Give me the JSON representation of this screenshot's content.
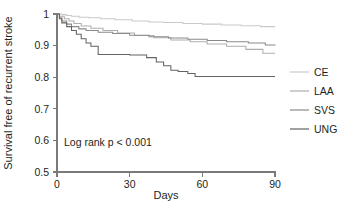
{
  "figure": {
    "type": "kaplan-meier-survival-plot",
    "background_color": "#ffffff",
    "annotation": "Log rank p < 0.001"
  },
  "axes": {
    "x_title": "Days",
    "y_title": "Survival free of recurrent stroke",
    "x_ticks": [
      "0",
      "30",
      "60",
      "90"
    ],
    "y_ticks": [
      "0.5",
      "0.6",
      "0.7",
      "0.8",
      "0.9",
      "1"
    ]
  },
  "legend": {
    "position": "right",
    "entries": [
      {
        "label": "CE",
        "color": "#c9c9c9"
      },
      {
        "label": "LAA",
        "color": "#aeaeae"
      },
      {
        "label": "SVS",
        "color": "#8a8a8a"
      },
      {
        "label": "UNG",
        "color": "#636363"
      }
    ]
  },
  "chart_data": {
    "type": "line",
    "subtype": "kaplan-meier step survival curves",
    "title": "",
    "subtitle": "",
    "xlabel": "Days",
    "ylabel": "Survival free of recurrent stroke",
    "xlim": [
      0,
      90
    ],
    "ylim": [
      0.5,
      1.0
    ],
    "xticks": [
      0,
      30,
      60,
      90
    ],
    "yticks": [
      0.5,
      0.6,
      0.7,
      0.8,
      0.9,
      1.0
    ],
    "grid": false,
    "legend_position": "right",
    "annotations": [
      {
        "text": "Log rank p < 0.001",
        "x": 5,
        "y": 0.6
      }
    ],
    "series": [
      {
        "name": "CE",
        "color": "#c9c9c9",
        "step": "post",
        "x": [
          0,
          2,
          4,
          6,
          9,
          13,
          18,
          24,
          31,
          38,
          44,
          52,
          60,
          68,
          76,
          84,
          90
        ],
        "y": [
          1.0,
          0.998,
          0.995,
          0.993,
          0.99,
          0.988,
          0.985,
          0.982,
          0.978,
          0.975,
          0.973,
          0.97,
          0.968,
          0.965,
          0.963,
          0.96,
          0.96
        ]
      },
      {
        "name": "LAA",
        "color": "#aeaeae",
        "step": "post",
        "x": [
          0,
          1,
          3,
          5,
          7,
          10,
          14,
          19,
          25,
          32,
          40,
          47,
          55,
          62,
          70,
          78,
          85,
          90
        ],
        "y": [
          1.0,
          0.993,
          0.985,
          0.978,
          0.97,
          0.962,
          0.955,
          0.948,
          0.94,
          0.932,
          0.925,
          0.918,
          0.912,
          0.905,
          0.898,
          0.888,
          0.876,
          0.876
        ]
      },
      {
        "name": "SVS",
        "color": "#8a8a8a",
        "step": "post",
        "x": [
          0,
          1,
          2,
          4,
          6,
          9,
          12,
          17,
          23,
          30,
          38,
          46,
          54,
          62,
          70,
          79,
          86,
          90
        ],
        "y": [
          1.0,
          0.988,
          0.978,
          0.968,
          0.96,
          0.953,
          0.948,
          0.942,
          0.938,
          0.933,
          0.928,
          0.924,
          0.92,
          0.916,
          0.912,
          0.908,
          0.902,
          0.9
        ]
      },
      {
        "name": "UNG",
        "color": "#636363",
        "step": "post",
        "x": [
          0,
          1,
          2,
          4,
          6,
          8,
          10,
          12,
          14,
          17,
          22,
          30,
          37,
          41,
          44,
          47,
          50,
          54,
          57,
          65,
          75,
          85,
          90
        ],
        "y": [
          1.0,
          0.985,
          0.972,
          0.96,
          0.948,
          0.936,
          0.922,
          0.908,
          0.898,
          0.872,
          0.872,
          0.87,
          0.862,
          0.848,
          0.836,
          0.822,
          0.818,
          0.812,
          0.802,
          0.802,
          0.802,
          0.802,
          0.802
        ]
      }
    ]
  },
  "geometry": {
    "plot_left_px": 57,
    "plot_right_px": 275,
    "plot_top_px": 14,
    "plot_bottom_px": 172
  }
}
